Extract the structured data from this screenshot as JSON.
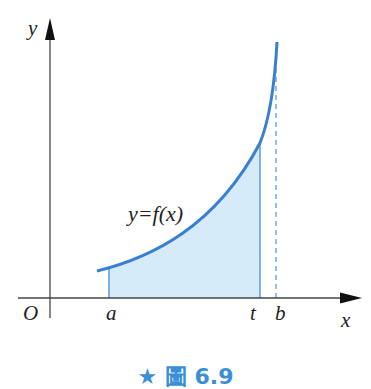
{
  "figure": {
    "caption": "★ 圖 6.9",
    "function_label": "y=f(x)",
    "axes": {
      "x_label": "x",
      "y_label": "y",
      "origin_label": "O"
    },
    "ticks": {
      "a": "a",
      "t": "t",
      "b": "b"
    },
    "colors": {
      "curve": "#3b7fcf",
      "fill": "#d5ebfa",
      "axis": "#333333",
      "caption": "#3a8fd6"
    }
  }
}
